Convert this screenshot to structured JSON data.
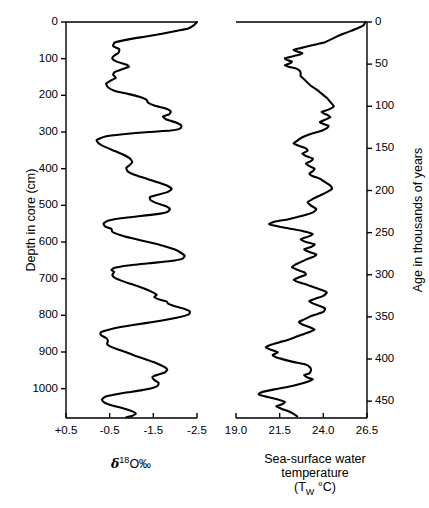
{
  "figure": {
    "type": "paleoclimate-core-figure",
    "background": "#ffffff",
    "line_color": "#000000"
  },
  "panels": {
    "left": {
      "name": "oxygen-isotope-panel",
      "y_axis_title": "Depth in core (cm)",
      "y_ticks": [
        0,
        100,
        200,
        300,
        400,
        500,
        600,
        700,
        800,
        900,
        1000
      ],
      "y_tick_labels": [
        "0",
        "100",
        "200",
        "300",
        "400",
        "500",
        "600",
        "700",
        "800",
        "900",
        "1000"
      ],
      "y_range": [
        0,
        1080
      ],
      "x_ticks": [
        0.5,
        -0.5,
        -1.5,
        -2.5
      ],
      "x_tick_labels": [
        "+0.5",
        "-0.5",
        "-1.5",
        "-2.5"
      ],
      "x_range": [
        0.5,
        -2.5
      ],
      "x_title_main": "O",
      "x_title_delta": "δ",
      "x_title_sup": "18",
      "x_title_permil": "‰"
    },
    "right": {
      "name": "sea-surface-temperature-panel",
      "y_axis_title": "Age in thousands of years",
      "y_ticks": [
        0,
        50,
        100,
        150,
        200,
        250,
        300,
        350,
        400,
        450
      ],
      "y_tick_labels": [
        "0",
        "50",
        "100",
        "150",
        "200",
        "250",
        "300",
        "350",
        "400",
        "450"
      ],
      "y_range": [
        0,
        470
      ],
      "x_ticks": [
        19.0,
        21.5,
        24.0,
        26.5
      ],
      "x_tick_labels": [
        "19.0",
        "21.5",
        "24.0",
        "26.5"
      ],
      "x_range": [
        19.0,
        26.5
      ],
      "x_title_line1": "Sea-surface water",
      "x_title_line2": "temperature",
      "x_title_line3_pre": "(T",
      "x_title_line3_sub": "W",
      "x_title_line3_post": "°C)"
    }
  },
  "chart_data": [
    {
      "type": "line",
      "name": "oxygen-isotope-record",
      "title": "",
      "xlabel": "δ18O ‰",
      "ylabel": "Depth in core (cm)",
      "xlim": [
        0.5,
        -2.5
      ],
      "ylim": [
        0,
        1080
      ],
      "x_inverted": true,
      "y_inverted": true,
      "grid": false,
      "legend": null,
      "x_name": "d18O",
      "y_name": "depth_cm",
      "points": [
        [
          -2.5,
          0
        ],
        [
          -2.44,
          8
        ],
        [
          -2.3,
          18
        ],
        [
          -2.05,
          24
        ],
        [
          -1.7,
          32
        ],
        [
          -1.3,
          40
        ],
        [
          -0.9,
          48
        ],
        [
          -0.62,
          56
        ],
        [
          -0.58,
          66
        ],
        [
          -0.72,
          74
        ],
        [
          -0.7,
          84
        ],
        [
          -0.6,
          92
        ],
        [
          -0.56,
          100
        ],
        [
          -0.66,
          108
        ],
        [
          -0.88,
          116
        ],
        [
          -0.94,
          122
        ],
        [
          -0.8,
          128
        ],
        [
          -0.62,
          136
        ],
        [
          -0.58,
          144
        ],
        [
          -0.64,
          152
        ],
        [
          -0.52,
          160
        ],
        [
          -0.42,
          168
        ],
        [
          -0.46,
          178
        ],
        [
          -0.62,
          188
        ],
        [
          -0.92,
          196
        ],
        [
          -1.18,
          204
        ],
        [
          -1.34,
          212
        ],
        [
          -1.38,
          220
        ],
        [
          -1.52,
          228
        ],
        [
          -1.78,
          236
        ],
        [
          -1.9,
          244
        ],
        [
          -1.86,
          252
        ],
        [
          -1.72,
          258
        ],
        [
          -1.8,
          266
        ],
        [
          -2.02,
          274
        ],
        [
          -2.14,
          282
        ],
        [
          -2.12,
          290
        ],
        [
          -1.9,
          296
        ],
        [
          -1.4,
          300
        ],
        [
          -0.8,
          306
        ],
        [
          -0.4,
          312
        ],
        [
          -0.2,
          322
        ],
        [
          -0.26,
          332
        ],
        [
          -0.42,
          342
        ],
        [
          -0.62,
          352
        ],
        [
          -0.82,
          362
        ],
        [
          -0.96,
          372
        ],
        [
          -1.02,
          382
        ],
        [
          -0.96,
          390
        ],
        [
          -0.88,
          398
        ],
        [
          -0.92,
          408
        ],
        [
          -1.1,
          418
        ],
        [
          -1.36,
          428
        ],
        [
          -1.62,
          438
        ],
        [
          -1.84,
          448
        ],
        [
          -1.92,
          456
        ],
        [
          -1.82,
          464
        ],
        [
          -1.58,
          472
        ],
        [
          -1.42,
          478
        ],
        [
          -1.44,
          486
        ],
        [
          -1.58,
          494
        ],
        [
          -1.78,
          502
        ],
        [
          -1.88,
          510
        ],
        [
          -1.82,
          518
        ],
        [
          -1.58,
          524
        ],
        [
          -1.16,
          530
        ],
        [
          -0.72,
          536
        ],
        [
          -0.46,
          542
        ],
        [
          -0.36,
          550
        ],
        [
          -0.4,
          558
        ],
        [
          -0.54,
          564
        ],
        [
          -0.56,
          572
        ],
        [
          -0.72,
          580
        ],
        [
          -1.02,
          590
        ],
        [
          -1.38,
          600
        ],
        [
          -1.72,
          610
        ],
        [
          -1.98,
          620
        ],
        [
          -2.14,
          630
        ],
        [
          -2.22,
          638
        ],
        [
          -2.16,
          646
        ],
        [
          -1.9,
          652
        ],
        [
          -1.4,
          658
        ],
        [
          -0.92,
          664
        ],
        [
          -0.62,
          670
        ],
        [
          -0.54,
          676
        ],
        [
          -0.6,
          682
        ],
        [
          -0.56,
          690
        ],
        [
          -0.62,
          698
        ],
        [
          -0.78,
          706
        ],
        [
          -0.98,
          714
        ],
        [
          -1.18,
          722
        ],
        [
          -1.36,
          730
        ],
        [
          -1.5,
          738
        ],
        [
          -1.58,
          744
        ],
        [
          -1.52,
          750
        ],
        [
          -1.62,
          756
        ],
        [
          -1.8,
          762
        ],
        [
          -1.84,
          768
        ],
        [
          -1.96,
          774
        ],
        [
          -2.2,
          782
        ],
        [
          -2.34,
          790
        ],
        [
          -2.3,
          798
        ],
        [
          -2.06,
          806
        ],
        [
          -1.7,
          814
        ],
        [
          -1.28,
          822
        ],
        [
          -0.86,
          830
        ],
        [
          -0.52,
          838
        ],
        [
          -0.3,
          846
        ],
        [
          -0.3,
          854
        ],
        [
          -0.42,
          862
        ],
        [
          -0.46,
          870
        ],
        [
          -0.44,
          878
        ],
        [
          -0.5,
          884
        ],
        [
          -0.66,
          892
        ],
        [
          -0.86,
          900
        ],
        [
          -1.08,
          910
        ],
        [
          -1.32,
          920
        ],
        [
          -1.56,
          930
        ],
        [
          -1.74,
          940
        ],
        [
          -1.82,
          948
        ],
        [
          -1.76,
          956
        ],
        [
          -1.6,
          962
        ],
        [
          -1.48,
          968
        ],
        [
          -1.52,
          976
        ],
        [
          -1.62,
          984
        ],
        [
          -1.6,
          992
        ],
        [
          -1.48,
          998
        ],
        [
          -1.24,
          1004
        ],
        [
          -0.92,
          1010
        ],
        [
          -0.62,
          1016
        ],
        [
          -0.4,
          1022
        ],
        [
          -0.32,
          1030
        ],
        [
          -0.38,
          1038
        ],
        [
          -0.56,
          1046
        ],
        [
          -0.82,
          1054
        ],
        [
          -1.02,
          1062
        ],
        [
          -1.1,
          1068
        ],
        [
          -1.02,
          1074
        ],
        [
          -0.88,
          1078
        ]
      ]
    },
    {
      "type": "line",
      "name": "sea-surface-temperature-record",
      "title": "",
      "xlabel": "Sea-surface water temperature (TW °C)",
      "ylabel": "Age in thousands of years",
      "xlim": [
        19.0,
        26.5
      ],
      "ylim": [
        0,
        470
      ],
      "x_inverted": false,
      "y_inverted": true,
      "grid": false,
      "legend": null,
      "x_name": "sst_c",
      "y_name": "age_ka",
      "points": [
        [
          26.4,
          0
        ],
        [
          26.3,
          4
        ],
        [
          25.9,
          8
        ],
        [
          25.4,
          12
        ],
        [
          24.9,
          16
        ],
        [
          24.5,
          20
        ],
        [
          24.1,
          24
        ],
        [
          23.7,
          26
        ],
        [
          23.3,
          28
        ],
        [
          22.7,
          31
        ],
        [
          22.3,
          33
        ],
        [
          22.5,
          35
        ],
        [
          22.8,
          37
        ],
        [
          22.6,
          39
        ],
        [
          22.2,
          41
        ],
        [
          21.8,
          43
        ],
        [
          21.9,
          45
        ],
        [
          22.2,
          47
        ],
        [
          22.1,
          49
        ],
        [
          21.8,
          51
        ],
        [
          22.0,
          53
        ],
        [
          22.4,
          55
        ],
        [
          22.6,
          57
        ],
        [
          22.7,
          60
        ],
        [
          22.7,
          64
        ],
        [
          22.9,
          68
        ],
        [
          23.1,
          72
        ],
        [
          23.3,
          76
        ],
        [
          23.6,
          80
        ],
        [
          23.9,
          85
        ],
        [
          24.2,
          90
        ],
        [
          24.4,
          95
        ],
        [
          24.6,
          100
        ],
        [
          24.3,
          104
        ],
        [
          23.9,
          107
        ],
        [
          24.2,
          110
        ],
        [
          24.4,
          113
        ],
        [
          24.1,
          116
        ],
        [
          23.8,
          119
        ],
        [
          24.0,
          121
        ],
        [
          24.3,
          123
        ],
        [
          24.2,
          126
        ],
        [
          23.9,
          129
        ],
        [
          23.4,
          132
        ],
        [
          23.0,
          135
        ],
        [
          22.7,
          138
        ],
        [
          22.5,
          141
        ],
        [
          22.3,
          144
        ],
        [
          22.6,
          147
        ],
        [
          23.0,
          150
        ],
        [
          23.1,
          153
        ],
        [
          22.8,
          156
        ],
        [
          23.0,
          159
        ],
        [
          23.4,
          162
        ],
        [
          23.3,
          165
        ],
        [
          23.0,
          168
        ],
        [
          23.2,
          171
        ],
        [
          23.5,
          174
        ],
        [
          23.4,
          177
        ],
        [
          23.2,
          180
        ],
        [
          23.4,
          183
        ],
        [
          23.8,
          186
        ],
        [
          24.1,
          190
        ],
        [
          24.4,
          194
        ],
        [
          24.5,
          198
        ],
        [
          24.2,
          202
        ],
        [
          23.8,
          206
        ],
        [
          23.4,
          210
        ],
        [
          23.1,
          214
        ],
        [
          23.3,
          218
        ],
        [
          23.6,
          222
        ],
        [
          23.4,
          226
        ],
        [
          22.8,
          230
        ],
        [
          22.0,
          234
        ],
        [
          21.2,
          237
        ],
        [
          20.9,
          240
        ],
        [
          21.5,
          243
        ],
        [
          22.3,
          246
        ],
        [
          23.0,
          249
        ],
        [
          23.4,
          252
        ],
        [
          23.1,
          255
        ],
        [
          22.7,
          258
        ],
        [
          23.0,
          261
        ],
        [
          23.5,
          264
        ],
        [
          23.3,
          267
        ],
        [
          22.9,
          270
        ],
        [
          23.2,
          273
        ],
        [
          23.6,
          276
        ],
        [
          23.4,
          279
        ],
        [
          23.0,
          282
        ],
        [
          22.7,
          285
        ],
        [
          22.4,
          288
        ],
        [
          22.2,
          291
        ],
        [
          22.5,
          294
        ],
        [
          22.9,
          297
        ],
        [
          23.0,
          300
        ],
        [
          22.6,
          303
        ],
        [
          22.3,
          306
        ],
        [
          22.6,
          309
        ],
        [
          23.1,
          312
        ],
        [
          23.5,
          315
        ],
        [
          23.9,
          318
        ],
        [
          24.2,
          321
        ],
        [
          24.0,
          325
        ],
        [
          23.6,
          328
        ],
        [
          23.2,
          331
        ],
        [
          23.4,
          334
        ],
        [
          23.8,
          337
        ],
        [
          24.1,
          340
        ],
        [
          24.0,
          344
        ],
        [
          23.6,
          347
        ],
        [
          23.2,
          350
        ],
        [
          22.9,
          353
        ],
        [
          22.6,
          356
        ],
        [
          22.8,
          359
        ],
        [
          23.2,
          362
        ],
        [
          23.5,
          365
        ],
        [
          23.2,
          368
        ],
        [
          22.8,
          371
        ],
        [
          22.4,
          374
        ],
        [
          22.0,
          377
        ],
        [
          21.5,
          380
        ],
        [
          21.0,
          383
        ],
        [
          20.7,
          386
        ],
        [
          21.0,
          389
        ],
        [
          21.4,
          392
        ],
        [
          21.1,
          395
        ],
        [
          21.3,
          398
        ],
        [
          21.8,
          401
        ],
        [
          22.4,
          404
        ],
        [
          22.9,
          406
        ],
        [
          23.2,
          409
        ],
        [
          23.3,
          413
        ],
        [
          23.2,
          417
        ],
        [
          22.9,
          419
        ],
        [
          23.1,
          422
        ],
        [
          23.4,
          424
        ],
        [
          23.1,
          427
        ],
        [
          22.6,
          430
        ],
        [
          22.0,
          433
        ],
        [
          21.2,
          436
        ],
        [
          20.5,
          439
        ],
        [
          20.3,
          442
        ],
        [
          20.8,
          445
        ],
        [
          21.4,
          448
        ],
        [
          21.8,
          451
        ],
        [
          21.6,
          454
        ],
        [
          21.3,
          456
        ],
        [
          21.6,
          459
        ],
        [
          22.0,
          462
        ],
        [
          22.3,
          465
        ],
        [
          22.5,
          468
        ]
      ]
    }
  ]
}
